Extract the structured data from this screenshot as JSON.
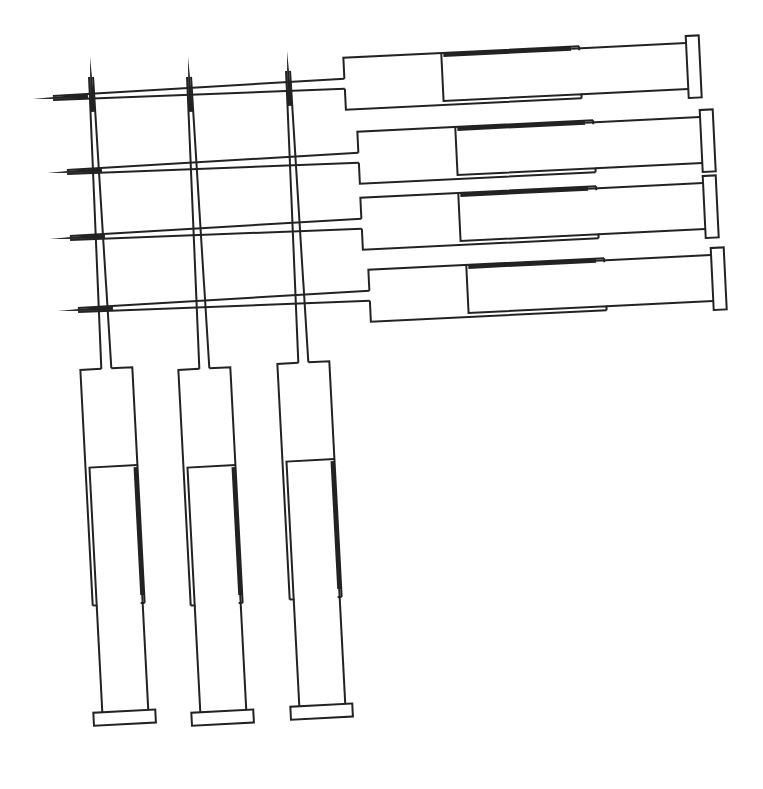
{
  "figure": {
    "title": "",
    "stroke_color": "#222222",
    "background_color": "#ffffff"
  },
  "syringes": [
    {
      "id": "horizontal-1",
      "orientation": "horizontal",
      "needle_direction": "left"
    },
    {
      "id": "horizontal-2",
      "orientation": "horizontal",
      "needle_direction": "left"
    },
    {
      "id": "horizontal-3",
      "orientation": "horizontal",
      "needle_direction": "left"
    },
    {
      "id": "horizontal-4",
      "orientation": "horizontal",
      "needle_direction": "left"
    },
    {
      "id": "vertical-1",
      "orientation": "vertical",
      "needle_direction": "up"
    },
    {
      "id": "vertical-2",
      "orientation": "vertical",
      "needle_direction": "up"
    },
    {
      "id": "vertical-3",
      "orientation": "vertical",
      "needle_direction": "up"
    }
  ]
}
